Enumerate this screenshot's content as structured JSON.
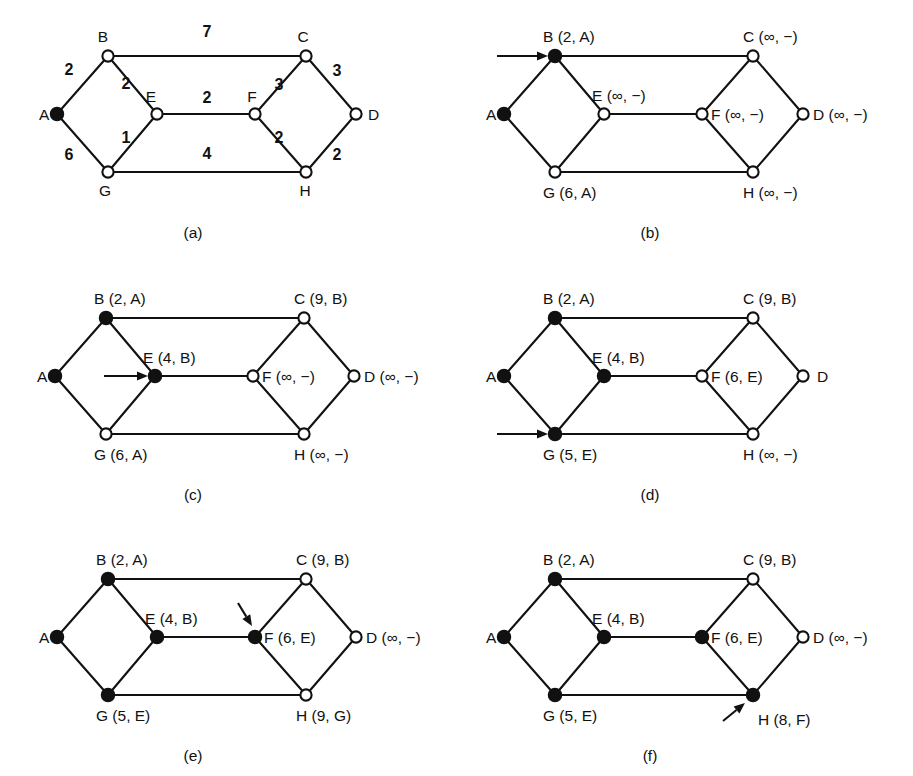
{
  "figure": {
    "panel_count": 6,
    "colors": {
      "ink": "#111111",
      "background": "#ffffff"
    }
  },
  "geometry": {
    "node_radius_open": 5.6,
    "node_radius_filled": 6.2,
    "panel_width": 456,
    "panel_height": 258,
    "nodes": {
      "A": {
        "x": 57,
        "y": 114
      },
      "B": {
        "x": 108,
        "y": 56
      },
      "E": {
        "x": 157,
        "y": 114
      },
      "G": {
        "x": 108,
        "y": 172
      },
      "F": {
        "x": 255,
        "y": 114
      },
      "C": {
        "x": 306,
        "y": 56
      },
      "H": {
        "x": 306,
        "y": 172
      },
      "D": {
        "x": 356,
        "y": 114
      }
    },
    "edges": [
      {
        "from": "A",
        "to": "B"
      },
      {
        "from": "A",
        "to": "G"
      },
      {
        "from": "B",
        "to": "E"
      },
      {
        "from": "B",
        "to": "C"
      },
      {
        "from": "E",
        "to": "G"
      },
      {
        "from": "E",
        "to": "F"
      },
      {
        "from": "G",
        "to": "H"
      },
      {
        "from": "F",
        "to": "C"
      },
      {
        "from": "F",
        "to": "H"
      },
      {
        "from": "C",
        "to": "D"
      },
      {
        "from": "H",
        "to": "D"
      }
    ]
  },
  "panels": [
    {
      "id": "a",
      "caption": "(a)",
      "caption_x": 193,
      "origin": {
        "x": 0,
        "y": 0
      },
      "filled_nodes": [
        "A"
      ],
      "arrow": null,
      "node_texts": {
        "A": {
          "text": "A",
          "x": -18,
          "y": 6,
          "anchor": "start"
        },
        "B": {
          "text": "B",
          "x": -5,
          "y": -14,
          "anchor": "middle"
        },
        "C": {
          "text": "C",
          "x": -3,
          "y": -14,
          "anchor": "middle"
        },
        "D": {
          "text": "D",
          "x": 12,
          "y": 6,
          "anchor": "start"
        },
        "E": {
          "text": "E",
          "x": -6,
          "y": -12,
          "anchor": "middle"
        },
        "F": {
          "text": "F",
          "x": -3,
          "y": -12,
          "anchor": "middle"
        },
        "G": {
          "text": "G",
          "x": -3,
          "y": 24,
          "anchor": "middle"
        },
        "H": {
          "text": "H",
          "x": -1,
          "y": 24,
          "anchor": "middle"
        }
      },
      "weights": [
        {
          "label": "2",
          "x": 69,
          "y": 75
        },
        {
          "label": "6",
          "x": 69,
          "y": 160
        },
        {
          "label": "2",
          "x": 126,
          "y": 89
        },
        {
          "label": "1",
          "x": 126,
          "y": 143
        },
        {
          "label": "7",
          "x": 207,
          "y": 37
        },
        {
          "label": "2",
          "x": 207,
          "y": 103
        },
        {
          "label": "4",
          "x": 207,
          "y": 159
        },
        {
          "label": "3",
          "x": 279,
          "y": 90
        },
        {
          "label": "2",
          "x": 279,
          "y": 143
        },
        {
          "label": "3",
          "x": 337,
          "y": 76
        },
        {
          "label": "2",
          "x": 337,
          "y": 160
        }
      ]
    },
    {
      "id": "b",
      "caption": "(b)",
      "caption_x": 650,
      "origin": {
        "x": 447,
        "y": 0
      },
      "filled_nodes": [
        "A",
        "B"
      ],
      "arrow": {
        "type": "horizontal",
        "x1": 50,
        "y1": 56,
        "x2": 101,
        "y2": 56
      },
      "node_texts": {
        "A": {
          "text": "A",
          "x": -18,
          "y": 6,
          "anchor": "start"
        },
        "B": {
          "text": "B (2, A)",
          "x": -12,
          "y": -14,
          "anchor": "start"
        },
        "C": {
          "text": "C (∞, −)",
          "x": -10,
          "y": -14,
          "anchor": "start"
        },
        "D": {
          "text": "D (∞, −)",
          "x": 10,
          "y": 6,
          "anchor": "start"
        },
        "E": {
          "text": "E (∞, −)",
          "x": -12,
          "y": -13,
          "anchor": "start"
        },
        "F": {
          "text": "F (∞, −)",
          "x": 9,
          "y": 6,
          "anchor": "start"
        },
        "G": {
          "text": "G (6, A)",
          "x": -12,
          "y": 26,
          "anchor": "start"
        },
        "H": {
          "text": "H (∞, −)",
          "x": -10,
          "y": 26,
          "anchor": "start"
        }
      },
      "weights": []
    },
    {
      "id": "c",
      "caption": "(c)",
      "caption_x": 193,
      "origin": {
        "x": -2,
        "y": 262
      },
      "filled_nodes": [
        "A",
        "B",
        "E"
      ],
      "arrow": {
        "type": "horizontal",
        "x1": 106,
        "y1": 114,
        "x2": 150,
        "y2": 114
      },
      "node_texts": {
        "A": {
          "text": "A",
          "x": -18,
          "y": 6,
          "anchor": "start"
        },
        "B": {
          "text": "B (2, A)",
          "x": -12,
          "y": -14,
          "anchor": "start"
        },
        "C": {
          "text": "C (9, B)",
          "x": -10,
          "y": -14,
          "anchor": "start"
        },
        "D": {
          "text": "D (∞, −)",
          "x": 10,
          "y": 6,
          "anchor": "start"
        },
        "E": {
          "text": "E (4, B)",
          "x": -12,
          "y": -13,
          "anchor": "start"
        },
        "F": {
          "text": "F (∞, −)",
          "x": 9,
          "y": 6,
          "anchor": "start"
        },
        "G": {
          "text": "G (6, A)",
          "x": -12,
          "y": 26,
          "anchor": "start"
        },
        "H": {
          "text": "H (∞, −)",
          "x": -10,
          "y": 26,
          "anchor": "start"
        }
      },
      "weights": []
    },
    {
      "id": "d",
      "caption": "(d)",
      "caption_x": 650,
      "origin": {
        "x": 447,
        "y": 262
      },
      "filled_nodes": [
        "A",
        "B",
        "E",
        "G"
      ],
      "arrow": {
        "type": "horizontal",
        "x1": 50,
        "y1": 172,
        "x2": 101,
        "y2": 172
      },
      "node_texts": {
        "A": {
          "text": "A",
          "x": -18,
          "y": 6,
          "anchor": "start"
        },
        "B": {
          "text": "B (2, A)",
          "x": -12,
          "y": -14,
          "anchor": "start"
        },
        "C": {
          "text": "C (9, B)",
          "x": -10,
          "y": -14,
          "anchor": "start"
        },
        "D": {
          "text": "D",
          "x": 14,
          "y": 6,
          "anchor": "start"
        },
        "E": {
          "text": "E (4, B)",
          "x": -12,
          "y": -13,
          "anchor": "start"
        },
        "F": {
          "text": "F (6, E)",
          "x": 9,
          "y": 6,
          "anchor": "start"
        },
        "G": {
          "text": "G (5, E)",
          "x": -12,
          "y": 26,
          "anchor": "start"
        },
        "H": {
          "text": "H (∞, −)",
          "x": -10,
          "y": 26,
          "anchor": "start"
        }
      },
      "weights": []
    },
    {
      "id": "e",
      "caption": "(e)",
      "caption_x": 193,
      "origin": {
        "x": 0,
        "y": 523
      },
      "filled_nodes": [
        "A",
        "B",
        "E",
        "G",
        "F"
      ],
      "arrow": {
        "type": "diagonal-down-right",
        "x1": 238,
        "y1": 80,
        "x2": 252,
        "y2": 103
      },
      "node_texts": {
        "A": {
          "text": "A",
          "x": -18,
          "y": 6,
          "anchor": "start"
        },
        "B": {
          "text": "B (2, A)",
          "x": -12,
          "y": -14,
          "anchor": "start"
        },
        "C": {
          "text": "C (9, B)",
          "x": -10,
          "y": -14,
          "anchor": "start"
        },
        "D": {
          "text": "D (∞, −)",
          "x": 10,
          "y": 6,
          "anchor": "start"
        },
        "E": {
          "text": "E (4, B)",
          "x": -12,
          "y": -13,
          "anchor": "start"
        },
        "F": {
          "text": "F (6, E)",
          "x": 9,
          "y": 6,
          "anchor": "start"
        },
        "G": {
          "text": "G (5, E)",
          "x": -12,
          "y": 26,
          "anchor": "start"
        },
        "H": {
          "text": "H (9, G)",
          "x": -10,
          "y": 26,
          "anchor": "start"
        }
      },
      "weights": []
    },
    {
      "id": "f",
      "caption": "(f)",
      "caption_x": 650,
      "origin": {
        "x": 447,
        "y": 523
      },
      "filled_nodes": [
        "A",
        "B",
        "E",
        "G",
        "F",
        "H"
      ],
      "arrow": {
        "type": "diagonal-up-right",
        "x1": 276,
        "y1": 198,
        "x2": 298,
        "y2": 180
      },
      "node_texts": {
        "A": {
          "text": "A",
          "x": -18,
          "y": 6,
          "anchor": "start"
        },
        "B": {
          "text": "B (2, A)",
          "x": -12,
          "y": -14,
          "anchor": "start"
        },
        "C": {
          "text": "C (9, B)",
          "x": -10,
          "y": -14,
          "anchor": "start"
        },
        "D": {
          "text": "D (∞, −)",
          "x": 10,
          "y": 6,
          "anchor": "start"
        },
        "E": {
          "text": "E (4, B)",
          "x": -12,
          "y": -13,
          "anchor": "start"
        },
        "F": {
          "text": "F (6, E)",
          "x": 9,
          "y": 6,
          "anchor": "start"
        },
        "G": {
          "text": "G (5, E)",
          "x": -12,
          "y": 26,
          "anchor": "start"
        },
        "H": {
          "text": "H (8, F)",
          "x": 5,
          "y": 30,
          "anchor": "start"
        }
      },
      "weights": []
    }
  ]
}
